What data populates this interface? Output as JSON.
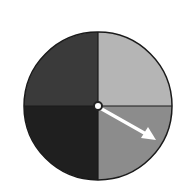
{
  "diagram": {
    "type": "spinner",
    "center": [
      98,
      106
    ],
    "radius": 74,
    "sections": [
      {
        "name": "top-left",
        "color": "#3a3a3a"
      },
      {
        "name": "top-right",
        "color": "#b5b5b5"
      },
      {
        "name": "bottom-left",
        "color": "#1f1f1f"
      },
      {
        "name": "bottom-right",
        "color": "#8c8c8c"
      }
    ],
    "pointer": {
      "tip": [
        155,
        139
      ],
      "color": "#ffffff"
    },
    "outline_color": "#1a1a1a"
  }
}
